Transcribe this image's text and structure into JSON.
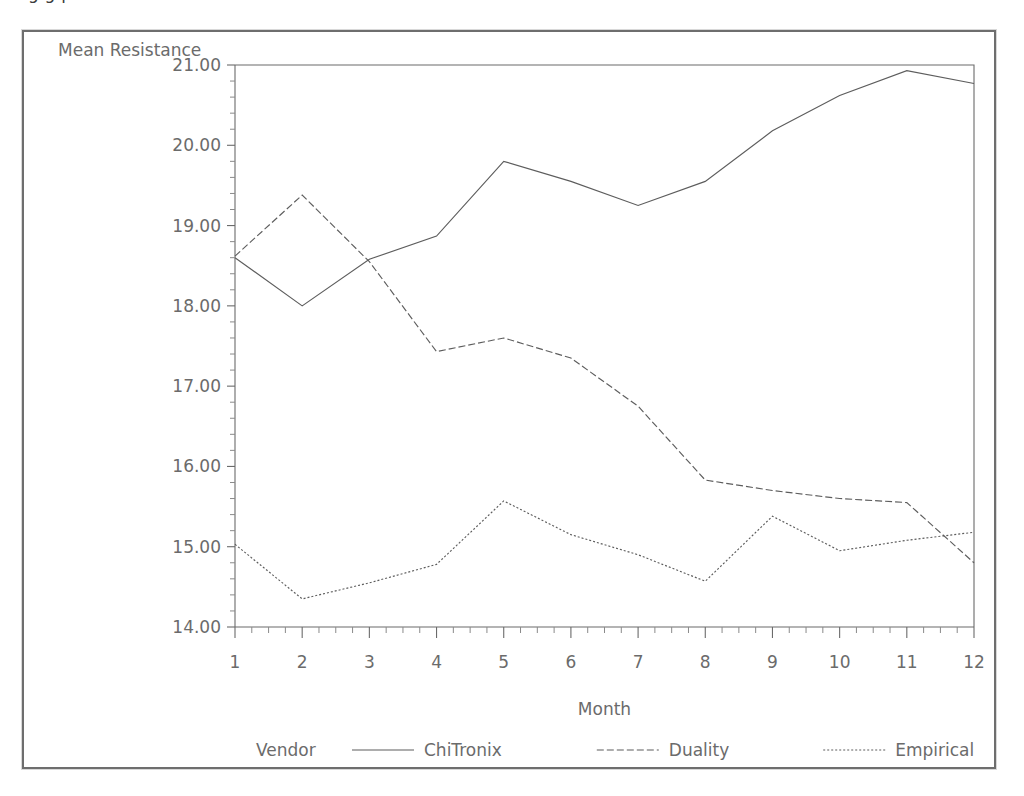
{
  "clipped_caption": "g                                  g                         p",
  "chart_data": {
    "type": "line",
    "title": "",
    "xlabel": "Month",
    "ylabel": "Mean Resistance",
    "x": [
      1,
      2,
      3,
      4,
      5,
      6,
      7,
      8,
      9,
      10,
      11,
      12
    ],
    "categories": [
      "1",
      "2",
      "3",
      "4",
      "5",
      "6",
      "7",
      "8",
      "9",
      "10",
      "11",
      "12"
    ],
    "xlim": [
      1,
      12
    ],
    "ylim": [
      14.0,
      21.0
    ],
    "ytick_labels": [
      "14.00",
      "15.00",
      "16.00",
      "17.00",
      "18.00",
      "19.00",
      "20.00",
      "21.00"
    ],
    "yticks": [
      14,
      15,
      16,
      17,
      18,
      19,
      20,
      21
    ],
    "y_minor_per_major": 5,
    "x_minor_per_major": 4,
    "grid": false,
    "legend_position": "bottom",
    "legend_title": "Vendor",
    "series": [
      {
        "name": "ChiTronix",
        "style": "solid",
        "dash": "none",
        "color": "#5d5d5d",
        "values": [
          18.6,
          18.0,
          18.58,
          18.87,
          19.8,
          19.55,
          19.25,
          19.55,
          20.18,
          20.62,
          20.93,
          20.77
        ]
      },
      {
        "name": "Duality",
        "style": "dashed",
        "dash": "7,3",
        "color": "#5d5d5d",
        "values": [
          18.62,
          19.38,
          18.55,
          17.43,
          17.6,
          17.35,
          16.75,
          15.83,
          15.7,
          15.6,
          15.55,
          14.8
        ]
      },
      {
        "name": "Empirical",
        "style": "dotted",
        "dash": "2,2",
        "color": "#5d5d5d",
        "values": [
          15.03,
          14.35,
          14.55,
          14.78,
          15.57,
          15.15,
          14.9,
          14.57,
          15.38,
          14.95,
          15.08,
          15.18
        ]
      }
    ]
  },
  "legend": {
    "title": "Vendor",
    "entries": [
      {
        "label": "ChiTronix",
        "style": "solid"
      },
      {
        "label": "Duality",
        "style": "dashed"
      },
      {
        "label": "Empirical",
        "style": "dotted"
      }
    ]
  },
  "axis": {
    "y_label": "Mean Resistance",
    "x_label": "Month"
  }
}
